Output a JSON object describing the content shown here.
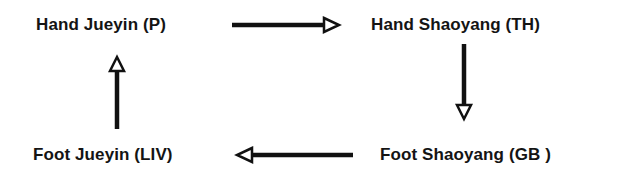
{
  "diagram": {
    "type": "cycle",
    "nodes": [
      {
        "id": "hand-jueyin",
        "label": "Hand Jueyin (P)"
      },
      {
        "id": "hand-shaoyang",
        "label": "Hand Shaoyang (TH)"
      },
      {
        "id": "foot-shaoyang",
        "label": "Foot Shaoyang (GB )"
      },
      {
        "id": "foot-jueyin",
        "label": "Foot Jueyin (LIV)"
      }
    ],
    "edges": [
      {
        "from": "hand-jueyin",
        "to": "hand-shaoyang",
        "direction": "right"
      },
      {
        "from": "hand-shaoyang",
        "to": "foot-shaoyang",
        "direction": "down"
      },
      {
        "from": "foot-shaoyang",
        "to": "foot-jueyin",
        "direction": "left"
      },
      {
        "from": "foot-jueyin",
        "to": "hand-jueyin",
        "direction": "up"
      }
    ],
    "colors": {
      "text": "#141414",
      "arrow": "#111111",
      "background": "#ffffff"
    }
  }
}
